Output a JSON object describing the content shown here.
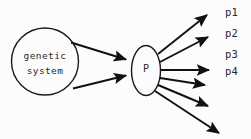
{
  "diagram": {
    "background_color": "#fcfcfc",
    "stroke_color": "#111111",
    "text_color": "#2a2a2a",
    "source_node": {
      "shape": "circle",
      "line1": "genetic",
      "line2": "system"
    },
    "process_node": {
      "shape": "ellipse",
      "label": "P"
    },
    "inputs": [
      {
        "name": "input-edge-upper"
      },
      {
        "name": "input-edge-lower"
      }
    ],
    "outputs": [
      {
        "label": "p1"
      },
      {
        "label": "p2"
      },
      {
        "label": "p3"
      },
      {
        "label": "p4"
      },
      {
        "label": ""
      },
      {
        "label": ""
      }
    ]
  }
}
